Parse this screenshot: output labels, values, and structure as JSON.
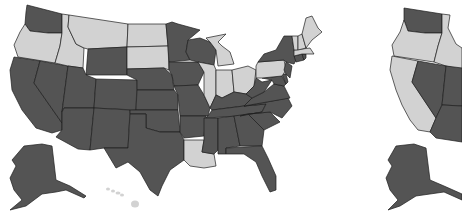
{
  "colors": {
    "dark": "#545454",
    "light": "#d2d2d2",
    "border": "#1e1e1e",
    "background": "#ffffff"
  },
  "legend_categories": [
    "dark",
    "light"
  ],
  "maps": [
    {
      "id": "map-a",
      "dark_states": [
        "WA",
        "CA",
        "NV",
        "UT",
        "AZ",
        "WY",
        "CO",
        "NM",
        "TX",
        "NE",
        "KS",
        "OK",
        "MN",
        "IA",
        "MO",
        "AR",
        "WI",
        "KY",
        "TN",
        "MS",
        "AL",
        "GA",
        "FL",
        "SC",
        "NC",
        "VA",
        "WV",
        "MD",
        "DE",
        "NJ",
        "NY",
        "CT",
        "RI",
        "AK"
      ],
      "light_states": [
        "OR",
        "ID",
        "MT",
        "ND",
        "SD",
        "MI",
        "IL",
        "IN",
        "OH",
        "PA",
        "ME",
        "NH",
        "VT",
        "MA",
        "LA",
        "HI"
      ]
    },
    {
      "id": "map-b",
      "cropped": true,
      "dark_states": [
        "WA",
        "NV",
        "UT",
        "AZ",
        "AK"
      ],
      "light_states": [
        "OR",
        "ID",
        "CA"
      ]
    }
  ]
}
